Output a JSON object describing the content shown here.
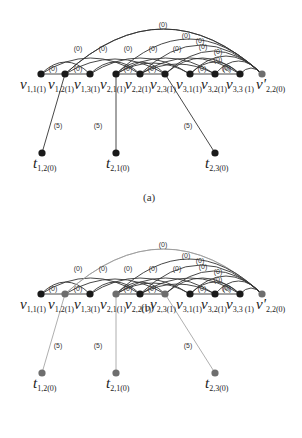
{
  "colors": {
    "node_dark": "#1a1a1a",
    "node_gray": "#6e6e6e",
    "edge_dark": "#333333",
    "edge_gray": "#9a9a9a"
  },
  "panels": [
    {
      "caption": "(a)",
      "offset_y": 0,
      "highlighted_nodes": [
        "v2.2p"
      ],
      "highlighted_edges": []
    },
    {
      "caption": "(b)",
      "offset_y": 220,
      "highlighted_nodes": [
        "v1.2",
        "v2.1",
        "v2.3",
        "v2.2p",
        "t1.2",
        "t2.1",
        "t2.3"
      ],
      "highlighted_edges": [
        "e_t12",
        "e_t21",
        "e_t23",
        "a_top",
        "a_v12_p"
      ]
    }
  ],
  "nodes": [
    {
      "id": "v1.1",
      "label": "v",
      "sub": "1,1",
      "weight": "(1)",
      "x": 41,
      "y": 74
    },
    {
      "id": "v1.2",
      "label": "v",
      "sub": "1,2",
      "weight": "(1)",
      "x": 65,
      "y": 74
    },
    {
      "id": "v1.3",
      "label": "v",
      "sub": "1,3",
      "weight": "(1)",
      "x": 90,
      "y": 74
    },
    {
      "id": "v2.1",
      "label": "v",
      "sub": "2,1",
      "weight": "(1)",
      "x": 116,
      "y": 74
    },
    {
      "id": "v2.2",
      "label": "v",
      "sub": "2,2",
      "weight": "(1)",
      "x": 140,
      "y": 74
    },
    {
      "id": "v2.3",
      "label": "v",
      "sub": "2,3",
      "weight": "(1)",
      "x": 165,
      "y": 74
    },
    {
      "id": "v3.1",
      "label": "v",
      "sub": "3,1",
      "weight": "(1)",
      "x": 190,
      "y": 74
    },
    {
      "id": "v3.2",
      "label": "v",
      "sub": "3,2",
      "weight": "(1)",
      "x": 215,
      "y": 74
    },
    {
      "id": "v3.3",
      "label": "v",
      "sub": "3,3",
      "weight": "(1)",
      "x": 240,
      "y": 74
    },
    {
      "id": "v2.2p",
      "label": "v'",
      "sub": "2,2",
      "weight": "(0)",
      "x": 262,
      "y": 74
    },
    {
      "id": "t1.2",
      "label": "t",
      "sub": "1,2",
      "weight": "(0)",
      "x": 42,
      "y": 153
    },
    {
      "id": "t2.1",
      "label": "t",
      "sub": "2,1",
      "weight": "(0)",
      "x": 116,
      "y": 153
    },
    {
      "id": "t2.3",
      "label": "t",
      "sub": "2,3",
      "weight": "(0)",
      "x": 215,
      "y": 153
    }
  ],
  "node_labels": [
    {
      "text": "v",
      "sub": "1,1(1)",
      "x": 20
    },
    {
      "text": "v",
      "sub": "1,2(1)",
      "x": 48
    },
    {
      "text": "v",
      "sub": "1,3(1)",
      "x": 74
    },
    {
      "text": "v",
      "sub": "2,1(1)",
      "x": 100
    },
    {
      "text": "v",
      "sub": "2,2(1)",
      "x": 125
    },
    {
      "text": "v",
      "sub": "2,3(1)",
      "x": 150
    },
    {
      "text": "v",
      "sub": "3,1(1)",
      "x": 176
    },
    {
      "text": "v",
      "sub": "3,2(1)",
      "x": 201
    },
    {
      "text": "v",
      "sub": "3,3 (1)",
      "x": 226
    },
    {
      "text": "v'",
      "sub": "2,2(0)",
      "x": 256
    }
  ],
  "terminal_labels": [
    {
      "text": "t",
      "sub": "1,2(0)",
      "x": 33
    },
    {
      "text": "t",
      "sub": "2,1(0)",
      "x": 106
    },
    {
      "text": "t",
      "sub": "2,3(0)",
      "x": 205
    }
  ],
  "edge_weight_labels": {
    "adjacent": "(0)",
    "arc": "(0)",
    "terminal": "(5)"
  },
  "terminal_edge_labels": [
    {
      "text": "(5)",
      "x": 58,
      "y": 128
    },
    {
      "text": "(5)",
      "x": 98,
      "y": 128
    },
    {
      "text": "(5)",
      "x": 188,
      "y": 128
    }
  ],
  "adjacent_edge_labels": [
    {
      "text": "(0)",
      "x": 53,
      "y": 71
    },
    {
      "text": "(0)",
      "x": 78,
      "y": 71
    },
    {
      "text": "(0)",
      "x": 128,
      "y": 71
    },
    {
      "text": "(0)",
      "x": 152,
      "y": 71
    },
    {
      "text": "(0)",
      "x": 202,
      "y": 71
    },
    {
      "text": "(0)",
      "x": 227,
      "y": 71
    }
  ],
  "arc_labels": [
    {
      "text": "(0)",
      "x": 78,
      "y": 51
    },
    {
      "text": "(0)",
      "x": 103,
      "y": 51
    },
    {
      "text": "(0)",
      "x": 128,
      "y": 51
    },
    {
      "text": "(0)",
      "x": 153,
      "y": 51
    },
    {
      "text": "(0)",
      "x": 177,
      "y": 51
    },
    {
      "text": "(0)",
      "x": 163,
      "y": 27
    },
    {
      "text": "(0)",
      "x": 186,
      "y": 38
    },
    {
      "text": "(0)",
      "x": 200,
      "y": 43
    },
    {
      "text": "(0)",
      "x": 203,
      "y": 49
    },
    {
      "text": "(0)",
      "x": 218,
      "y": 54
    },
    {
      "text": "(0)",
      "x": 218,
      "y": 62
    },
    {
      "text": "(0)",
      "x": 226,
      "y": 70
    }
  ]
}
